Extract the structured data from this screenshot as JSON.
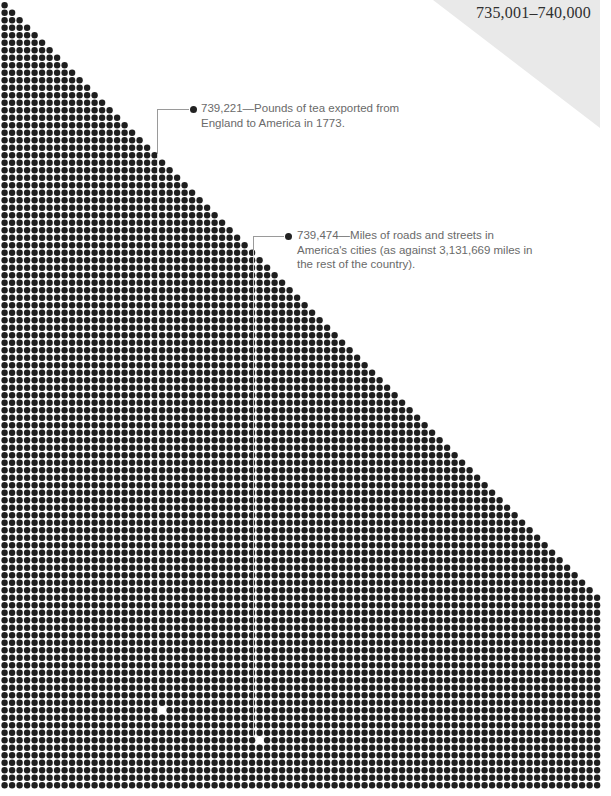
{
  "page": {
    "title": "735,001–740,000",
    "corner_color": "#e9e9e9"
  },
  "grid": {
    "columns": 80,
    "rows": 105,
    "pitch": 7.5,
    "origin_x": 4.6,
    "origin_y": 5.2,
    "dot_diameter": 6.4,
    "dot_color": "#1f1f1f",
    "layout": "triangle rows grow by one dot until full width, then full rows",
    "gaps": [
      {
        "label": "739,221",
        "x": 162.5,
        "y": 713
      },
      {
        "label": "739,474",
        "x": 259,
        "y": 737
      }
    ]
  },
  "callouts": [
    {
      "value": "739,221",
      "dash": "—",
      "text": "Pounds of tea exported from\nEngland to America in 1773.",
      "line_x": 157,
      "line_y": 109,
      "line_bottom": 713,
      "dot_x": 193,
      "text_x": 201
    },
    {
      "value": "739,474",
      "dash": "—",
      "text": "Miles of roads and streets in\nAmerica's cities (as against 3,131,669 miles in\nthe rest of the country).",
      "line_x": 253,
      "line_y": 236,
      "line_bottom": 737,
      "dot_x": 288,
      "text_x": 297
    }
  ]
}
